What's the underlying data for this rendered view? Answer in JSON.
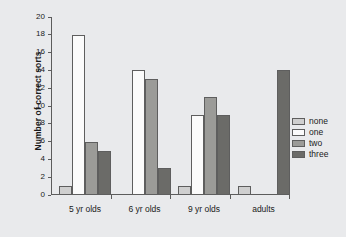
{
  "chart_data": {
    "type": "bar",
    "title": "",
    "xlabel": "",
    "ylabel": "Number of correct sorts",
    "categories": [
      "5 yr olds",
      "6 yr olds",
      "9 yr olds",
      "adults"
    ],
    "series": [
      {
        "name": "none",
        "color": "#cfcfcf",
        "values": [
          1,
          0,
          1,
          1
        ]
      },
      {
        "name": "one",
        "color": "#fbfbfb",
        "values": [
          18,
          14,
          9,
          0
        ]
      },
      {
        "name": "two",
        "color": "#9b9b98",
        "values": [
          6,
          13,
          11,
          0
        ]
      },
      {
        "name": "three",
        "color": "#6b6b68",
        "values": [
          5,
          3,
          9,
          14
        ]
      }
    ],
    "ylim": [
      0,
      20
    ],
    "ytick_step": 2,
    "yticks": [
      0,
      2,
      4,
      6,
      8,
      10,
      12,
      14,
      16,
      18,
      20
    ],
    "grid": false,
    "legend_position": "right",
    "legend_entries": [
      "none",
      "one",
      "two",
      "three"
    ],
    "background_color": "#e9eaec",
    "axis_color": "#5c5c5c",
    "bar_edge_color": "#5e5e5e"
  }
}
